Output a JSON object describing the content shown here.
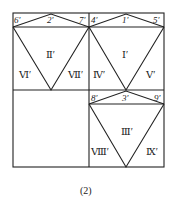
{
  "figure": {
    "caption": "(2)",
    "stroke_color": "#222222",
    "point_labels": {
      "p1": "1′",
      "p2": "2′",
      "p3": "3′",
      "p4": "4′",
      "p5": "5′",
      "p6": "6′",
      "p7": "7′",
      "p8": "8′",
      "p9": "9′"
    },
    "region_labels": {
      "r1": "Ⅰ′",
      "r2": "Ⅱ′",
      "r3": "Ⅲ′",
      "r4": "Ⅳ′",
      "r5": "Ⅴ′",
      "r6": "Ⅵ′",
      "r7": "Ⅶ′",
      "r8": "Ⅷ′",
      "r9": "Ⅸ′"
    }
  }
}
